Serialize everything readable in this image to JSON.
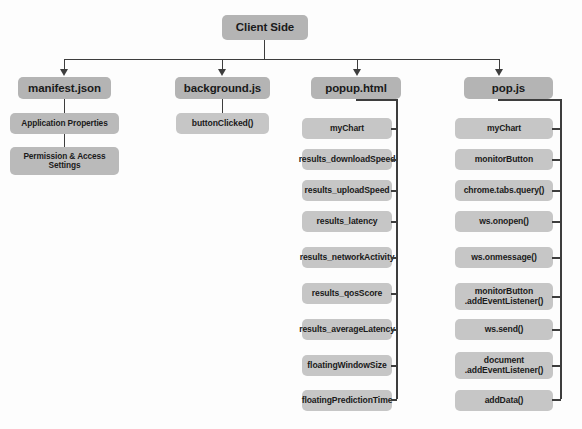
{
  "diagram": {
    "title": "Client Side",
    "root": {
      "label": "Client Side"
    },
    "columns": [
      {
        "id": "manifest",
        "header": "manifest.json",
        "connector_style": "stacked",
        "children": [
          {
            "label": "Application Properties"
          },
          {
            "label": "Permission & Access Settings"
          }
        ]
      },
      {
        "id": "background",
        "header": "background.js",
        "connector_style": "stacked",
        "children": [
          {
            "label": "buttonClicked()"
          }
        ]
      },
      {
        "id": "popup",
        "header": "popup.html",
        "connector_style": "spine",
        "children": [
          {
            "label": "myChart"
          },
          {
            "label": "results_downloadSpeed"
          },
          {
            "label": "results_uploadSpeed"
          },
          {
            "label": "results_latency"
          },
          {
            "label": "results_networkActivity"
          },
          {
            "label": "results_qosScore"
          },
          {
            "label": "results_averageLatency"
          },
          {
            "label": "floatingWindowSize"
          },
          {
            "label": "floatingPredictionTime"
          }
        ]
      },
      {
        "id": "popjs",
        "header": "pop.js",
        "connector_style": "spine",
        "children": [
          {
            "label": "myChart"
          },
          {
            "label": "monitorButton"
          },
          {
            "label": "chrome.tabs.query()"
          },
          {
            "label": "ws.onopen()"
          },
          {
            "label": "ws.onmessage()"
          },
          {
            "label": "monitorButton\n.addEventListener()"
          },
          {
            "label": "ws.send()"
          },
          {
            "label": "document\n.addEventListener()"
          },
          {
            "label": "addData()"
          }
        ]
      }
    ],
    "colors": {
      "background": "#fdfdfd",
      "header_box": "#b4b4b4",
      "child_box": "#c6c6c6",
      "child_box_alt": "#bababa",
      "connector": "#3d3d3d",
      "text": "#1a1a1a"
    }
  }
}
